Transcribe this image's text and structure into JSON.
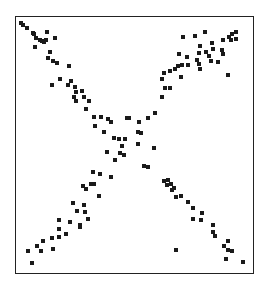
{
  "chart_data": {
    "type": "scatter",
    "title": "",
    "xlabel": "",
    "ylabel": "",
    "grid": false,
    "legend": null,
    "axes": {
      "orientation": "y increases downward (matrix style)",
      "xlim": [
        0,
        1
      ],
      "ylim": [
        0,
        1
      ],
      "ticks": "none"
    },
    "marker": {
      "shape": "square",
      "size_px": 4,
      "color": "#1a1a1a"
    },
    "frame_px": {
      "left": 15,
      "top": 16,
      "right": 254,
      "bottom": 274
    },
    "points_px": [
      [
        21,
        23
      ],
      [
        23,
        25
      ],
      [
        27,
        28
      ],
      [
        33,
        33
      ],
      [
        34,
        34
      ],
      [
        36,
        38
      ],
      [
        40,
        40
      ],
      [
        42,
        41
      ],
      [
        44,
        42
      ],
      [
        46,
        40
      ],
      [
        47,
        32
      ],
      [
        55,
        38
      ],
      [
        35,
        47
      ],
      [
        50,
        52
      ],
      [
        48,
        58
      ],
      [
        53,
        61
      ],
      [
        57,
        63
      ],
      [
        69,
        66
      ],
      [
        60,
        79
      ],
      [
        52,
        85
      ],
      [
        68,
        85
      ],
      [
        71,
        81
      ],
      [
        75,
        87
      ],
      [
        76,
        92
      ],
      [
        82,
        91
      ],
      [
        84,
        97
      ],
      [
        74,
        97
      ],
      [
        76,
        101
      ],
      [
        89,
        101
      ],
      [
        86,
        109
      ],
      [
        94,
        117
      ],
      [
        101,
        117
      ],
      [
        108,
        119
      ],
      [
        111,
        122
      ],
      [
        95,
        126
      ],
      [
        104,
        132
      ],
      [
        114,
        138
      ],
      [
        119,
        139
      ],
      [
        125,
        139
      ],
      [
        107,
        152
      ],
      [
        122,
        146
      ],
      [
        120,
        153
      ],
      [
        124,
        155
      ],
      [
        115,
        160
      ],
      [
        138,
        132
      ],
      [
        138,
        144
      ],
      [
        154,
        148
      ],
      [
        144,
        166
      ],
      [
        148,
        167
      ],
      [
        164,
        181
      ],
      [
        168,
        180
      ],
      [
        167,
        185
      ],
      [
        171,
        184
      ],
      [
        172,
        190
      ],
      [
        174,
        188
      ],
      [
        176,
        197
      ],
      [
        181,
        196
      ],
      [
        188,
        202
      ],
      [
        193,
        208
      ],
      [
        202,
        213
      ],
      [
        193,
        219
      ],
      [
        201,
        220
      ],
      [
        213,
        225
      ],
      [
        213,
        232
      ],
      [
        215,
        236
      ],
      [
        228,
        241
      ],
      [
        224,
        246
      ],
      [
        228,
        250
      ],
      [
        232,
        251
      ],
      [
        176,
        250
      ],
      [
        226,
        259
      ],
      [
        243,
        262
      ],
      [
        183,
        37
      ],
      [
        195,
        36
      ],
      [
        205,
        32
      ],
      [
        229,
        37
      ],
      [
        232,
        34
      ],
      [
        236,
        32
      ],
      [
        231,
        40
      ],
      [
        236,
        39
      ],
      [
        223,
        40
      ],
      [
        212,
        43
      ],
      [
        200,
        46
      ],
      [
        213,
        49
      ],
      [
        206,
        52
      ],
      [
        222,
        50
      ],
      [
        223,
        54
      ],
      [
        179,
        54
      ],
      [
        187,
        57
      ],
      [
        199,
        53
      ],
      [
        197,
        60
      ],
      [
        209,
        56
      ],
      [
        178,
        66
      ],
      [
        199,
        64
      ],
      [
        200,
        69
      ],
      [
        211,
        61
      ],
      [
        218,
        62
      ],
      [
        164,
        73
      ],
      [
        175,
        69
      ],
      [
        182,
        65
      ],
      [
        188,
        65
      ],
      [
        181,
        77
      ],
      [
        170,
        71
      ],
      [
        162,
        79
      ],
      [
        165,
        88
      ],
      [
        170,
        88
      ],
      [
        228,
        75
      ],
      [
        162,
        97
      ],
      [
        155,
        113
      ],
      [
        148,
        118
      ],
      [
        129,
        118
      ],
      [
        139,
        122
      ],
      [
        141,
        133
      ],
      [
        127,
        118
      ],
      [
        100,
        174
      ],
      [
        93,
        172
      ],
      [
        111,
        177
      ],
      [
        83,
        186
      ],
      [
        86,
        189
      ],
      [
        91,
        184
      ],
      [
        94,
        184
      ],
      [
        99,
        196
      ],
      [
        73,
        203
      ],
      [
        84,
        205
      ],
      [
        77,
        211
      ],
      [
        85,
        212
      ],
      [
        88,
        219
      ],
      [
        59,
        220
      ],
      [
        70,
        222
      ],
      [
        80,
        225
      ],
      [
        80,
        227
      ],
      [
        59,
        229
      ],
      [
        66,
        234
      ],
      [
        59,
        237
      ],
      [
        52,
        238
      ],
      [
        43,
        241
      ],
      [
        37,
        246
      ],
      [
        53,
        249
      ],
      [
        41,
        251
      ],
      [
        28,
        251
      ],
      [
        32,
        263
      ]
    ]
  }
}
